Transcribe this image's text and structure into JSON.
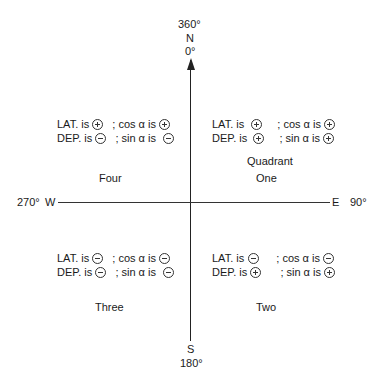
{
  "compass": {
    "north": {
      "degrees_top": "360°",
      "letter": "N",
      "degrees_bottom": "0°"
    },
    "south": {
      "letter": "S",
      "degrees": "180°"
    },
    "west": {
      "degrees": "270°",
      "letter": "W"
    },
    "east": {
      "letter": "E",
      "degrees": "90°"
    }
  },
  "quadrants": {
    "four": {
      "name": "Four",
      "lat_label": "LAT. is",
      "lat_sign": "minus_plus",
      "lat": "+",
      "cos_label": "; cos α is",
      "cos": "+",
      "dep_label": "DEP. is",
      "dep": "−",
      "sin_label": "; sin α is",
      "sin": "−"
    },
    "one": {
      "name_line1": "Quadrant",
      "name": "One",
      "lat_label": "LAT. is",
      "lat": "+",
      "cos_label": "; cos α is",
      "cos": "+",
      "dep_label": "DEP. is",
      "dep": "+",
      "sin_label": "; sin α is",
      "sin": "+"
    },
    "three": {
      "name": "Three",
      "lat_label": "LAT. is",
      "lat": "−",
      "cos_label": "; cos α is",
      "cos": "−",
      "dep_label": "DEP. is",
      "dep": "−",
      "sin_label": "; sin α is",
      "sin": "−"
    },
    "two": {
      "name": "Two",
      "lat_label": "LAT. is",
      "lat": "−",
      "cos_label": "; cos α is",
      "cos": "−",
      "dep_label": "DEP. is",
      "dep": "+",
      "sin_label": "; sin α is",
      "sin": "+"
    }
  }
}
